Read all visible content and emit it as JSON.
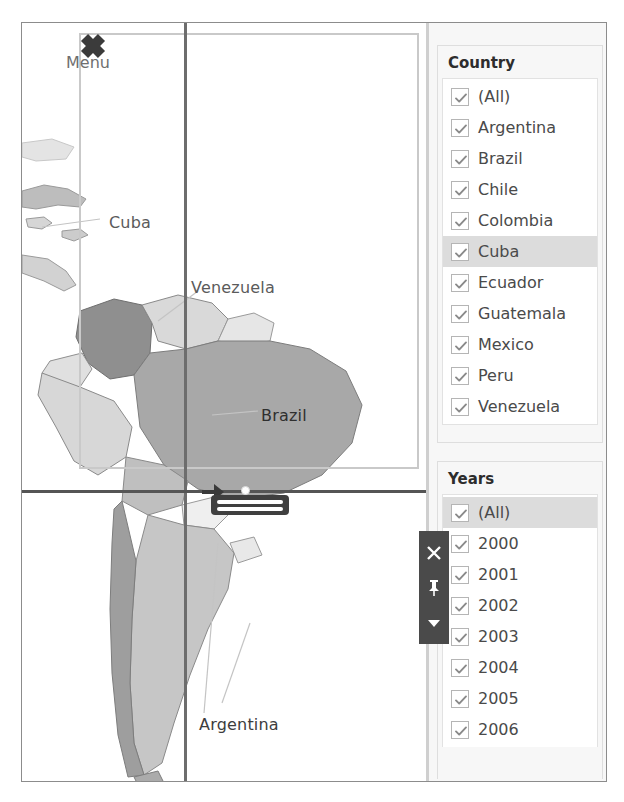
{
  "map": {
    "menu_label": "Menu",
    "menu_marker_icon": "cross-marker-icon",
    "labels": {
      "cuba": "Cuba",
      "venezuela": "Venezuela",
      "brazil": "Brazil",
      "argentina": "Argentina"
    },
    "arrow_icon": "arrow-right-icon",
    "slider_widget_name": "map-slider-widget"
  },
  "filters": {
    "country": {
      "title": "Country",
      "items": [
        {
          "label": "(All)",
          "checked": true,
          "selected": false
        },
        {
          "label": "Argentina",
          "checked": true,
          "selected": false
        },
        {
          "label": "Brazil",
          "checked": true,
          "selected": false
        },
        {
          "label": "Chile",
          "checked": true,
          "selected": false
        },
        {
          "label": "Colombia",
          "checked": true,
          "selected": false
        },
        {
          "label": "Cuba",
          "checked": true,
          "selected": true
        },
        {
          "label": "Ecuador",
          "checked": true,
          "selected": false
        },
        {
          "label": "Guatemala",
          "checked": true,
          "selected": false
        },
        {
          "label": "Mexico",
          "checked": true,
          "selected": false
        },
        {
          "label": "Peru",
          "checked": true,
          "selected": false
        },
        {
          "label": "Venezuela",
          "checked": true,
          "selected": false
        }
      ]
    },
    "years": {
      "title": "Years",
      "items": [
        {
          "label": "(All)",
          "checked": true,
          "selected": true
        },
        {
          "label": "2000",
          "checked": true,
          "selected": false
        },
        {
          "label": "2001",
          "checked": true,
          "selected": false
        },
        {
          "label": "2002",
          "checked": true,
          "selected": false
        },
        {
          "label": "2003",
          "checked": true,
          "selected": false
        },
        {
          "label": "2004",
          "checked": true,
          "selected": false
        },
        {
          "label": "2005",
          "checked": true,
          "selected": false
        },
        {
          "label": "2006",
          "checked": true,
          "selected": false
        }
      ]
    }
  },
  "toolbar": {
    "buttons": [
      {
        "icon": "close-icon",
        "title": "Close"
      },
      {
        "icon": "pin-icon",
        "title": "Pin"
      },
      {
        "icon": "chevron-down-icon",
        "title": "More"
      }
    ]
  },
  "colors": {
    "frame_border": "#8c8c8c",
    "panel_bg": "#f7f7f7",
    "row_selected": "#dcdcdc",
    "toolbar_bg": "#4a4a4a",
    "marquee_border": "#c9c9c9"
  }
}
